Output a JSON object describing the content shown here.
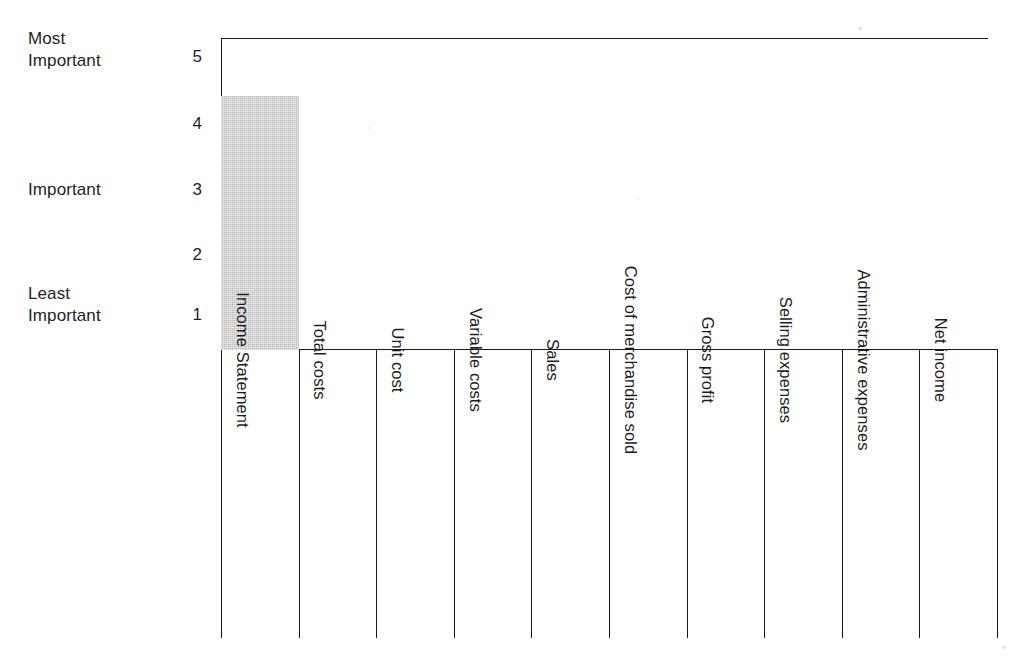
{
  "chart_data": {
    "type": "bar",
    "title": "",
    "xlabel": "",
    "ylabel": "",
    "ylim": [
      0,
      5.4
    ],
    "grid": false,
    "legend": null,
    "categories": [
      "Income Statement",
      "Total costs",
      "Unit cost",
      "Variable costs",
      "Sales",
      "Cost of merchandise sold",
      "Gross profit",
      "Selling expenses",
      "Administrative expenses",
      "Net income"
    ],
    "values": [
      4.4,
      0,
      0,
      0,
      0,
      0,
      0,
      0,
      0,
      0
    ],
    "y_ticks": [
      1,
      2,
      3,
      4,
      5
    ],
    "y_tick_labels": [
      "1",
      "2",
      "3",
      "4",
      "5"
    ],
    "y_category_labels": [
      {
        "text": "Most\nImportant",
        "at_tick": 5
      },
      {
        "text": "Important",
        "at_tick": 3
      },
      {
        "text": "Least\nImportant",
        "at_tick": 1
      }
    ],
    "bar_color": "#bcbcbc",
    "axis_color": "#1a1a1a"
  },
  "axis": {
    "ticks": [
      {
        "value": "5"
      },
      {
        "value": "4"
      },
      {
        "value": "3"
      },
      {
        "value": "2"
      },
      {
        "value": "1"
      }
    ],
    "most_important": "Most\nImportant",
    "important": "Important",
    "least_important": "Least\nImportant"
  },
  "table": {
    "columns": [
      {
        "label": "Income Statement"
      },
      {
        "label": "Total costs"
      },
      {
        "label": "Unit cost"
      },
      {
        "label": "Variable costs"
      },
      {
        "label": "Sales"
      },
      {
        "label": "Cost of merchandise sold"
      },
      {
        "label": "Gross profit"
      },
      {
        "label": "Selling expenses"
      },
      {
        "label": "Administrative expenses"
      },
      {
        "label": "Net income"
      }
    ]
  }
}
